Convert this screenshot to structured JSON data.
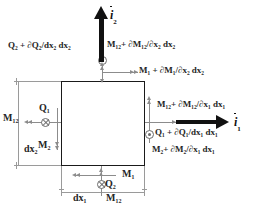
{
  "diagram": {
    "element": {
      "name": "plate-element-square",
      "edge_color": "#1a1a1a",
      "fill": "#ffffff"
    },
    "colors": {
      "outline": "#1a1a1a",
      "force_lines": "#8c8c8c",
      "unit_vector": "#111111",
      "dimension": "#9a9a9a",
      "text": "#262626"
    },
    "unit_vectors": [
      {
        "id": "i2",
        "label_base": "i",
        "label_sub": "2",
        "direction": "up"
      },
      {
        "id": "i1",
        "label_base": "i",
        "label_sub": "1",
        "direction": "right"
      }
    ],
    "labels": {
      "top_left_shear": "Q₂ + ∂Q₂/dx₂ dx₂",
      "top_twist_moment": "M₁₂+ ∂M₁₂/∂x₂ dx₂",
      "top_bending_moment": "M₁ + ∂M₁/∂x₂ dx₂",
      "right_twist_moment": "M₁₂+ ∂M₁₂/∂x₁ dx₁",
      "right_shear": "Q₁ + ∂Q₁/dx₁ dx₁",
      "right_bending_moment": "M₂+ ∂M₂/∂x₁ dx₁",
      "left_twist_moment": "M₁₂",
      "left_shear": "Q₁",
      "left_bending_moment": "M₂",
      "bottom_bending_moment": "M₁",
      "bottom_shear": "Q₂",
      "bottom_twist_moment": "M₁₂",
      "dim_horizontal": "dx₁",
      "dim_vertical": "dx₂"
    },
    "glyphs": {
      "out_of_page": "circled-dot",
      "into_page": "circled-cross"
    }
  }
}
